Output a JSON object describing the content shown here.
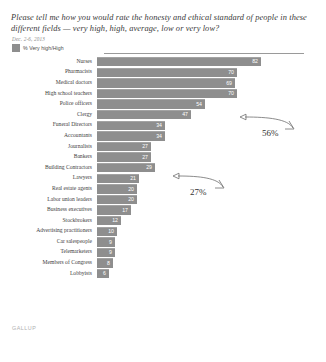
{
  "header": {
    "question": "Please tell me how you would rate the honesty and ethical standard of people in these different fields — very high, high, average, low or very low?",
    "date_range": "Dec. 2-6, 2013",
    "legend_label": "% Very high/High"
  },
  "footer": {
    "logo": "GALLUP"
  },
  "annotations": [
    {
      "name": "annotation-police",
      "text": "56%"
    },
    {
      "name": "annotation-journalists",
      "text": "27%"
    }
  ],
  "chart_data": {
    "type": "bar",
    "orientation": "horizontal",
    "title": "Please tell me how you would rate the honesty and ethical standard of people in these different fields — very high, high, average, low or very low?",
    "subtitle": "Dec. 2-6, 2013",
    "xlabel": "",
    "ylabel": "",
    "xlim": [
      0,
      100
    ],
    "grid": false,
    "legend": [
      "% Very high/High"
    ],
    "legend_position": "top-left",
    "series_name": "% Very high/High",
    "categories": [
      "Nurses",
      "Pharmacists",
      "Medical doctors",
      "High school teachers",
      "Police officers",
      "Clergy",
      "Funeral Directors",
      "Accountants",
      "Journalists",
      "Bankers",
      "Building Contractors",
      "Lawyers",
      "Real estate agents",
      "Labor union leaders",
      "Business executives",
      "Stockbrokers",
      "Advertising practitioners",
      "Car salespeople",
      "Telemarketers",
      "Members of Congress",
      "Lobbyists"
    ],
    "values": [
      82,
      70,
      69,
      70,
      54,
      47,
      34,
      34,
      27,
      27,
      29,
      21,
      20,
      20,
      17,
      12,
      10,
      9,
      9,
      8,
      6
    ],
    "annotations": [
      {
        "label": "56%",
        "points_to": "Police officers"
      },
      {
        "label": "27%",
        "points_to": "Journalists"
      }
    ]
  }
}
